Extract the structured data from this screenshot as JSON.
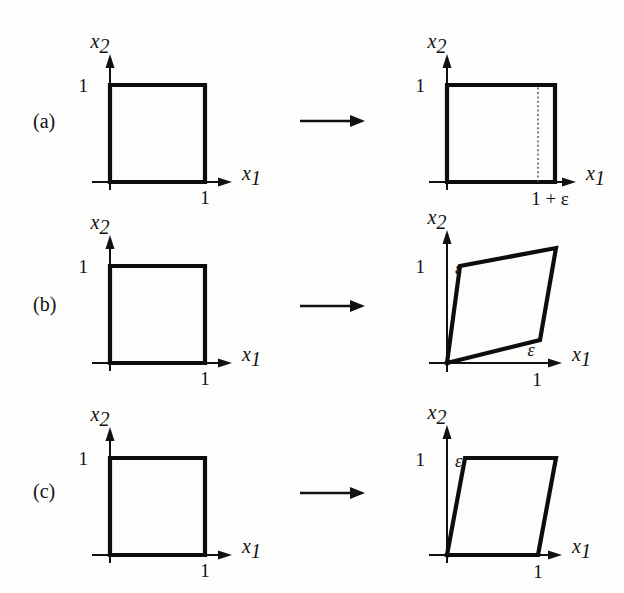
{
  "figure": {
    "background_color": "#fdfdfc",
    "line_color": "#0d0d0d",
    "axis_color": "#111111",
    "dotted_color": "#4a4a4a",
    "width": 624,
    "height": 593
  },
  "axis_labels": {
    "x_axis_base": "x",
    "x_axis_sub": "1",
    "y_axis_base": "x",
    "y_axis_sub": "2"
  },
  "rows": [
    {
      "id": "a",
      "label": "(a)",
      "arrow": "→",
      "before": {
        "caption": "unit square",
        "y_tick": "1",
        "x_tick": "1",
        "shape": "square",
        "vertices": [
          [
            0,
            0
          ],
          [
            1,
            0
          ],
          [
            1,
            1
          ],
          [
            0,
            1
          ]
        ]
      },
      "after": {
        "caption": "uniaxial extension",
        "y_tick": "1",
        "x_tick": "1 + ε",
        "shape": "rectangle",
        "vertices": [
          [
            0,
            0
          ],
          [
            1.18,
            0
          ],
          [
            1.18,
            1
          ],
          [
            0,
            1
          ]
        ],
        "dotted_at_x": 1.0,
        "dotted": true
      }
    },
    {
      "id": "b",
      "label": "(b)",
      "arrow": "→",
      "before": {
        "caption": "unit square",
        "y_tick": "1",
        "x_tick": "1",
        "shape": "square",
        "vertices": [
          [
            0,
            0
          ],
          [
            1,
            0
          ],
          [
            1,
            1
          ],
          [
            0,
            1
          ]
        ]
      },
      "after": {
        "caption": "pure shear",
        "y_tick": "1",
        "x_tick": "1",
        "eps_label_y": "ε",
        "eps_label_x": "ε",
        "shape": "parallelogram",
        "vertices": [
          [
            0,
            0
          ],
          [
            1,
            0.18
          ],
          [
            1.18,
            1.18
          ],
          [
            0.15,
            1
          ]
        ]
      }
    },
    {
      "id": "c",
      "label": "(c)",
      "arrow": "→",
      "before": {
        "caption": "unit square",
        "y_tick": "1",
        "x_tick": "1",
        "shape": "square",
        "vertices": [
          [
            0,
            0
          ],
          [
            1,
            0
          ],
          [
            1,
            1
          ],
          [
            0,
            1
          ]
        ]
      },
      "after": {
        "caption": "simple shear",
        "y_tick": "1",
        "x_tick": "1",
        "eps_label_y": "ε",
        "shape": "parallelogram",
        "vertices": [
          [
            0,
            0
          ],
          [
            1,
            0
          ],
          [
            1.2,
            1
          ],
          [
            0.2,
            1
          ]
        ]
      }
    }
  ]
}
